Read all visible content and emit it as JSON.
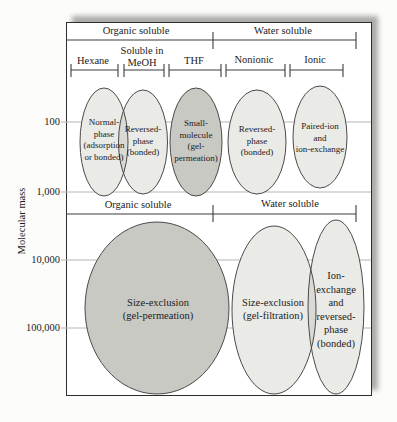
{
  "headers": {
    "top_left": "Organic soluble",
    "top_right": "Water soluble",
    "mid_left": "Organic soluble",
    "mid_right": "Water soluble"
  },
  "solvent_brackets": {
    "hexane": "Hexane",
    "soluble_in_meoh": "Soluble in\nMeOH",
    "thf": "THF",
    "nonionic": "Nonionic",
    "ionic": "Ionic"
  },
  "y_axis": {
    "title": "Molecular mass",
    "ticks": [
      "100",
      "1,000",
      "10,000",
      "100,000"
    ]
  },
  "methods": {
    "normal_phase": "Normal-\nphase\n(adsorption\nor bonded)",
    "reversed_phase_organic": "Reversed-\nphase\n(bonded)",
    "small_molecule_gp": "Small-\nmolecule\n(gel-\npermeation)",
    "reversed_phase_water": "Reversed-\nphase\n(bonded)",
    "paired_ion": "Paired-ion\nand\nion-exchange",
    "size_exclusion_gp": "Size-exclusion\n(gel-permeation)",
    "size_exclusion_gf": "Size-exclusion\n(gel-filtration)",
    "ion_exchange_rp": "Ion-\nexchange\nand\nreversed-\nphase\n(bonded)"
  },
  "colors": {
    "ellipse_light": "#eaeae6",
    "ellipse_dark": "#c9c9c4",
    "grid_line": "#b6b6b2",
    "rule_line": "#3c3c3c",
    "frame_border": "#2d2d2d",
    "text": "#1b1b1b"
  }
}
